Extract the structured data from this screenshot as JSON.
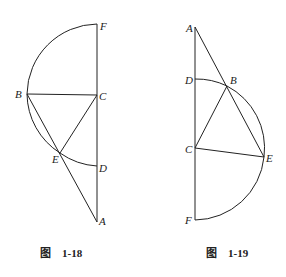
{
  "figures": [
    {
      "caption_prefix": "图",
      "caption_number": "1-18",
      "points": {
        "F": [
          97,
          24
        ],
        "C": [
          97,
          95
        ],
        "B": [
          27,
          94
        ],
        "E": [
          60,
          153
        ],
        "D": [
          97,
          166
        ],
        "A": [
          97,
          222
        ]
      },
      "labels": {
        "F": "F",
        "C": "C",
        "B": "B",
        "E": "E",
        "D": "D",
        "A": "A"
      }
    },
    {
      "caption_prefix": "图",
      "caption_number": "1-19",
      "points": {
        "A": [
          195,
          27
        ],
        "D": [
          195,
          79
        ],
        "B": [
          227,
          86
        ],
        "C": [
          195,
          148
        ],
        "E": [
          264,
          157
        ],
        "F": [
          195,
          220
        ]
      },
      "labels": {
        "A": "A",
        "D": "D",
        "B": "B",
        "C": "C",
        "E": "E",
        "F": "F"
      }
    }
  ],
  "colors": {
    "stroke": "#222222",
    "background": "#ffffff"
  }
}
